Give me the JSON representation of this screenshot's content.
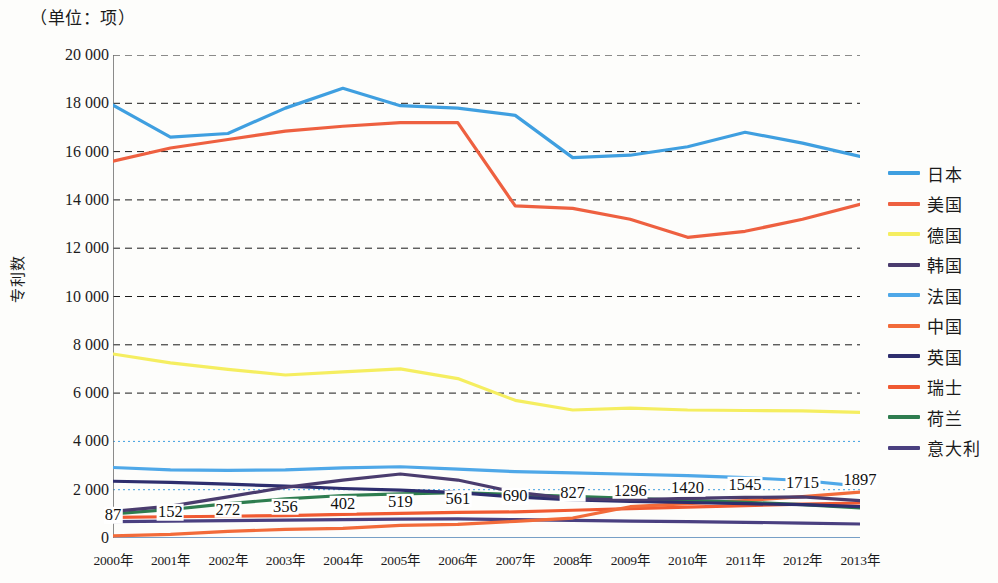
{
  "unit_caption": "（单位：项）",
  "y_axis_title": "专利数",
  "chart_data": {
    "type": "line",
    "title": "",
    "subtitle": "（单位：项）",
    "xlabel": "",
    "ylabel": "专利数",
    "ylim": [
      0,
      20000
    ],
    "ytick_labels": [
      "20 000",
      "18 000",
      "16 000",
      "14 000",
      "12 000",
      "10 000",
      "8 000",
      "6 000",
      "4 000",
      "2 000",
      "0"
    ],
    "ytick_values": [
      20000,
      18000,
      16000,
      14000,
      12000,
      10000,
      8000,
      6000,
      4000,
      2000,
      0
    ],
    "grid": true,
    "legend_position": "right",
    "categories": [
      "2000年",
      "2001年",
      "2002年",
      "2003年",
      "2004年",
      "2005年",
      "2006年",
      "2007年",
      "2008年",
      "2009年",
      "2010年",
      "2011年",
      "2012年",
      "2013年"
    ],
    "data_labels": [
      "87",
      "152",
      "272",
      "356",
      "402",
      "519",
      "561",
      "690",
      "827",
      "1296",
      "1420",
      "1545",
      "1715",
      "1897"
    ],
    "data_labels_series": "中国",
    "series": [
      {
        "name": "日本",
        "color": "#3f9fe0",
        "values": [
          17920,
          16600,
          16750,
          17800,
          18620,
          17900,
          17800,
          17500,
          15750,
          15850,
          16200,
          16800,
          16350,
          15800
        ]
      },
      {
        "name": "美国",
        "color": "#ee6040",
        "values": [
          15600,
          16150,
          16500,
          16850,
          17050,
          17200,
          17200,
          13750,
          13650,
          13200,
          12450,
          12700,
          13200,
          13820
        ]
      },
      {
        "name": "德国",
        "color": "#f5ee60",
        "values": [
          7620,
          7250,
          6980,
          6750,
          6880,
          7000,
          6600,
          5700,
          5300,
          5380,
          5300,
          5280,
          5260,
          5200
        ]
      },
      {
        "name": "韩国",
        "color": "#4a3c6e",
        "values": [
          1100,
          1320,
          1700,
          2100,
          2400,
          2650,
          2400,
          1900,
          1620,
          1580,
          1640,
          1680,
          1700,
          1550
        ]
      },
      {
        "name": "法国",
        "color": "#4fa8e8",
        "values": [
          2920,
          2820,
          2800,
          2820,
          2900,
          2950,
          2850,
          2750,
          2700,
          2640,
          2580,
          2500,
          2380,
          2150
        ]
      },
      {
        "name": "中国",
        "color": "#f26b3a",
        "values": [
          87,
          152,
          272,
          356,
          402,
          519,
          561,
          690,
          827,
          1296,
          1420,
          1545,
          1715,
          1897
        ]
      },
      {
        "name": "英国",
        "color": "#2e2e6e",
        "values": [
          2350,
          2300,
          2230,
          2150,
          2050,
          1980,
          1880,
          1700,
          1580,
          1520,
          1470,
          1420,
          1380,
          1300
        ]
      },
      {
        "name": "瑞士",
        "color": "#f05a32",
        "values": [
          850,
          880,
          900,
          930,
          980,
          1020,
          1060,
          1080,
          1150,
          1220,
          1280,
          1340,
          1400,
          1450
        ]
      },
      {
        "name": "荷兰",
        "color": "#2e7d4f",
        "values": [
          1000,
          1180,
          1420,
          1620,
          1760,
          1830,
          1880,
          1800,
          1720,
          1640,
          1560,
          1480,
          1380,
          1250
        ]
      },
      {
        "name": "意大利",
        "color": "#4a4080",
        "values": [
          680,
          700,
          720,
          740,
          760,
          780,
          790,
          760,
          730,
          700,
          680,
          650,
          620,
          580
        ]
      }
    ]
  },
  "legend": {
    "items": [
      {
        "label": "日本",
        "color": "#3f9fe0"
      },
      {
        "label": "美国",
        "color": "#ee6040"
      },
      {
        "label": "德国",
        "color": "#f5ee60"
      },
      {
        "label": "韩国",
        "color": "#4a3c6e"
      },
      {
        "label": "法国",
        "color": "#4fa8e8"
      },
      {
        "label": "中国",
        "color": "#f26b3a"
      },
      {
        "label": "英国",
        "color": "#2e2e6e"
      },
      {
        "label": "瑞士",
        "color": "#f05a32"
      },
      {
        "label": "荷兰",
        "color": "#2e7d4f"
      },
      {
        "label": "意大利",
        "color": "#4a4080"
      }
    ]
  }
}
